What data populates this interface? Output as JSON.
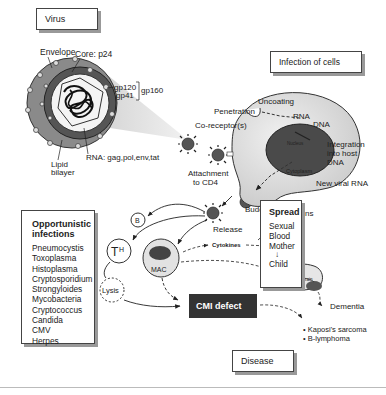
{
  "sections": {
    "virus": "Virus",
    "infection": "Infection of cells",
    "disease": "Disease"
  },
  "virus_labels": {
    "envelope": "Envelope",
    "core": "Core: p24",
    "gp120": "gp120",
    "gp41": "gp41",
    "gp160": "gp160",
    "lipid_bilayer_1": "Lipid",
    "lipid_bilayer_2": "bilayer",
    "rna": "RNA: gag,pol,env,tat"
  },
  "cell_labels": {
    "penetration": "Penetration",
    "uncoating": "Uncoating",
    "rna": "RNA",
    "dna": "DNA",
    "co_receptor": "Co-receptor(s)",
    "integration_1": "Integration",
    "integration_2": "into host",
    "integration_3": "DNA",
    "attachment_1": "Attachment",
    "attachment_2": "to CD4",
    "nucleus": "Nucleus",
    "cytoplasm": "Cytoplasm",
    "new_viral_rna": "New viral RNA",
    "budding": "Budding",
    "viral_proteins_1": "Viral",
    "viral_proteins_2": "proteins",
    "release": "Release"
  },
  "immune": {
    "b": "B",
    "th": "T",
    "th_sub": "H",
    "mac": "MAC",
    "lysis": "Lysis",
    "cytokines": "Cytokines",
    "fever": "fever",
    "weight_loss": "weight loss",
    "brain": "Brain",
    "dementia": "Dementia",
    "cmi_defect": "CMI defect",
    "kaposi": "• Kaposi's sarcoma",
    "b_lymphoma": "• B-lymphoma"
  },
  "opportunistic": {
    "title_1": "Opportunistic",
    "title_2": "infections",
    "items": [
      "Pneumocystis",
      "Toxoplasma",
      "Histoplasma",
      "Cryptosporidium",
      "Strongyloides",
      "Mycobacteria",
      "Cryptococcus",
      "Candida",
      "CMV",
      "Herpes"
    ]
  },
  "spread": {
    "title": "Spread",
    "items": [
      "Sexual",
      "Blood",
      "Mother"
    ],
    "arrow": "↓",
    "child": "Child"
  }
}
